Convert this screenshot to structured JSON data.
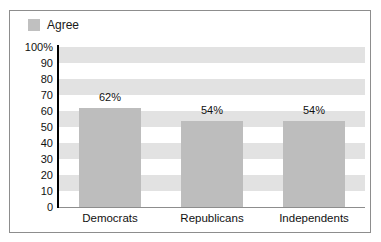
{
  "chart_data": {
    "type": "bar",
    "title": "",
    "subtitle": "",
    "xlabel": "",
    "ylabel": "",
    "categories": [
      "Democrats",
      "Republicans",
      "Independents"
    ],
    "values": [
      62,
      54,
      54
    ],
    "data_labels": [
      "62%",
      "54%",
      "54%"
    ],
    "series": [
      {
        "name": "Agree",
        "values": [
          62,
          54,
          54
        ],
        "color": "#bdbdbd"
      }
    ],
    "ylim": [
      0,
      100
    ],
    "y_tick_values": [
      100,
      90,
      80,
      70,
      60,
      50,
      40,
      30,
      20,
      10,
      0
    ],
    "y_tick_labels": [
      "100%",
      "90",
      "80",
      "70",
      "60",
      "50",
      "40",
      "30",
      "20",
      "10",
      "0"
    ],
    "grid": "horizontal-alternating-bands",
    "band_colors": [
      "#e2e2e2",
      "#ffffff"
    ],
    "legend": {
      "position": "top-left",
      "entries": [
        {
          "label": "Agree",
          "swatch_color": "#c0c0c0"
        }
      ]
    },
    "axis_line_color": "#000000",
    "frame_color": "#8d8d8d",
    "background": "#ffffff"
  }
}
